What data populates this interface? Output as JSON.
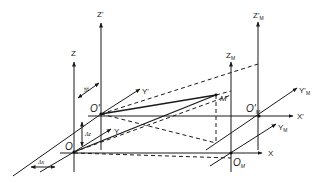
{
  "diagram": {
    "labels": {
      "z": "Z",
      "z_prime": "Z'",
      "z_m": "Z",
      "z_m_sub": "M",
      "z_m_prime": "Z'",
      "z_m_prime_sub": "M",
      "y": "Y",
      "y_prime": "Y'",
      "y_m": "Y",
      "y_m_sub": "M",
      "y_m_prime": "Y'",
      "y_m_prime_sub": "M",
      "x": "X",
      "x_prime": "X'",
      "origin_o": "O",
      "origin_o_prime": "O'",
      "origin_om": "O",
      "origin_om_sub": "M",
      "origin_om_prime": "O'",
      "origin_om_prime_sub": "M",
      "point_m": "M",
      "delta_x": "Δx",
      "delta_y": "Δy",
      "delta_z": "Δz"
    },
    "colors": {
      "line": "#1a1a1a",
      "background": "#ffffff"
    }
  }
}
